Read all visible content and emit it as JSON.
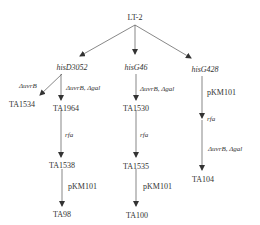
{
  "diagram": {
    "root": "LT-2",
    "branches": [
      {
        "parent": "hisD3052",
        "children": [
          {
            "edge": "ΔuvrB",
            "node": "TA1534"
          },
          {
            "edge": "ΔuvrB, Δgal",
            "node": "TA1964",
            "chain": [
              {
                "edge": "rfa",
                "node": "TA1538"
              },
              {
                "edge": "pKM101",
                "node": "TA98"
              }
            ]
          }
        ]
      },
      {
        "parent": "hisG46",
        "chain": [
          {
            "edge": "ΔuvrB, Δgal",
            "node": "TA1530"
          },
          {
            "edge": "rfa",
            "node": "TA1535"
          },
          {
            "edge": "pKM101",
            "node": "TA100"
          }
        ]
      },
      {
        "parent": "hisG428",
        "chain": [
          {
            "edge": "pKM101",
            "node": ""
          },
          {
            "edge": "rfa",
            "node": ""
          },
          {
            "edge": "ΔuvrB, Δgal",
            "node": "TA104"
          }
        ]
      }
    ]
  },
  "labels": {
    "root": "LT-2",
    "hisD3052": "hisD3052",
    "hisG46": "hisG46",
    "hisG428": "hisG428",
    "ta1534": "TA1534",
    "ta1964": "TA1964",
    "ta1538": "TA1538",
    "ta98": "TA98",
    "ta1530": "TA1530",
    "ta1535": "TA1535",
    "ta100": "TA100",
    "ta104": "TA104",
    "e_uvrb": "ΔuvrB",
    "e_uvrb_gal_left": "ΔuvrB, Δgal",
    "e_rfa_left": "rfa",
    "e_pkm_left": "pKM101",
    "e_uvrb_gal_mid": "ΔuvrB, Δgal",
    "e_rfa_mid": "rfa",
    "e_pkm_mid": "pKM101",
    "e_pkm_right": "pKM101",
    "e_rfa_right": "rfa",
    "e_uvrb_gal_right": "ΔuvrB, Δgal"
  }
}
